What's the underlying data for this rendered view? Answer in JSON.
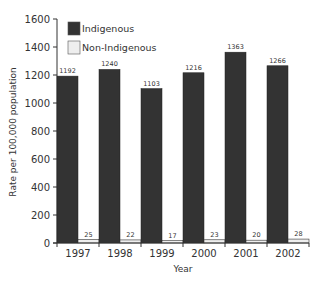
{
  "chart_data": {
    "type": "bar",
    "title": "",
    "xlabel": "Year",
    "ylabel": "Rate per 100,000 population",
    "categories": [
      "1997",
      "1998",
      "1999",
      "2000",
      "2001",
      "2002"
    ],
    "series": [
      {
        "name": "Indigenous",
        "color": "#333333",
        "values": [
          1192,
          1240,
          1103,
          1216,
          1363,
          1266
        ]
      },
      {
        "name": "Non-Indigenous",
        "color": "#eeeeee",
        "values": [
          25,
          22,
          17,
          23,
          20,
          28
        ]
      }
    ],
    "ylim": [
      0,
      1600
    ],
    "yticks": [
      0,
      200,
      400,
      600,
      800,
      1000,
      1200,
      1400,
      1600
    ],
    "grid": false,
    "legend_position": "top-left inside",
    "data_labels": true
  }
}
